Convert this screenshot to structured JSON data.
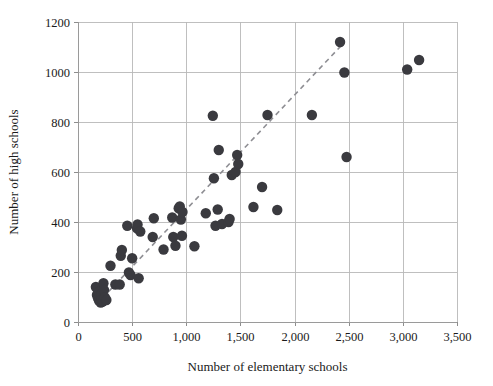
{
  "chart_data": {
    "type": "scatter",
    "title": "",
    "xlabel": "Number of elementary schools",
    "ylabel": "Number of high schools",
    "xlim": [
      0,
      3500
    ],
    "ylim": [
      0,
      1200
    ],
    "xticks": [
      0,
      500,
      1000,
      1500,
      2000,
      2500,
      3000,
      3500
    ],
    "xticklabels": [
      "0",
      "500",
      "1,000",
      "1,500",
      "2,000",
      "2,500",
      "3,000",
      "3,500"
    ],
    "yticks": [
      0,
      200,
      400,
      600,
      800,
      1000,
      1200
    ],
    "yticklabels": [
      "0",
      "200",
      "400",
      "600",
      "800",
      "1000",
      "1200"
    ],
    "grid": true,
    "legend": "none",
    "marker_color": "#3a3a3f",
    "marker_size": 5.2,
    "trendline": {
      "style": "dashed",
      "color": "#8e8e93",
      "x": [
        170,
        2430
      ],
      "y": [
        70,
        1105
      ]
    },
    "points": [
      {
        "x": 165,
        "y": 140
      },
      {
        "x": 175,
        "y": 108
      },
      {
        "x": 185,
        "y": 95
      },
      {
        "x": 190,
        "y": 120
      },
      {
        "x": 195,
        "y": 85
      },
      {
        "x": 205,
        "y": 100
      },
      {
        "x": 210,
        "y": 78
      },
      {
        "x": 215,
        "y": 112
      },
      {
        "x": 220,
        "y": 92
      },
      {
        "x": 228,
        "y": 82
      },
      {
        "x": 235,
        "y": 155
      },
      {
        "x": 240,
        "y": 128
      },
      {
        "x": 248,
        "y": 98
      },
      {
        "x": 262,
        "y": 88
      },
      {
        "x": 300,
        "y": 225
      },
      {
        "x": 345,
        "y": 150
      },
      {
        "x": 385,
        "y": 150
      },
      {
        "x": 395,
        "y": 265
      },
      {
        "x": 405,
        "y": 288
      },
      {
        "x": 455,
        "y": 385
      },
      {
        "x": 470,
        "y": 198
      },
      {
        "x": 485,
        "y": 188
      },
      {
        "x": 500,
        "y": 255
      },
      {
        "x": 545,
        "y": 375
      },
      {
        "x": 550,
        "y": 390
      },
      {
        "x": 560,
        "y": 175
      },
      {
        "x": 575,
        "y": 362
      },
      {
        "x": 690,
        "y": 340
      },
      {
        "x": 700,
        "y": 415
      },
      {
        "x": 790,
        "y": 290
      },
      {
        "x": 870,
        "y": 418
      },
      {
        "x": 880,
        "y": 340
      },
      {
        "x": 900,
        "y": 305
      },
      {
        "x": 930,
        "y": 455
      },
      {
        "x": 940,
        "y": 462
      },
      {
        "x": 950,
        "y": 410
      },
      {
        "x": 960,
        "y": 345
      },
      {
        "x": 965,
        "y": 440
      },
      {
        "x": 1075,
        "y": 303
      },
      {
        "x": 1180,
        "y": 435
      },
      {
        "x": 1245,
        "y": 825
      },
      {
        "x": 1255,
        "y": 575
      },
      {
        "x": 1270,
        "y": 385
      },
      {
        "x": 1290,
        "y": 450
      },
      {
        "x": 1300,
        "y": 688
      },
      {
        "x": 1330,
        "y": 392
      },
      {
        "x": 1390,
        "y": 400
      },
      {
        "x": 1400,
        "y": 412
      },
      {
        "x": 1420,
        "y": 588
      },
      {
        "x": 1455,
        "y": 600
      },
      {
        "x": 1470,
        "y": 668
      },
      {
        "x": 1480,
        "y": 632
      },
      {
        "x": 1620,
        "y": 460
      },
      {
        "x": 1700,
        "y": 540
      },
      {
        "x": 1750,
        "y": 828
      },
      {
        "x": 1840,
        "y": 448
      },
      {
        "x": 2160,
        "y": 828
      },
      {
        "x": 2420,
        "y": 1120
      },
      {
        "x": 2460,
        "y": 998
      },
      {
        "x": 2480,
        "y": 660
      },
      {
        "x": 3040,
        "y": 1010
      },
      {
        "x": 3150,
        "y": 1048
      }
    ]
  }
}
